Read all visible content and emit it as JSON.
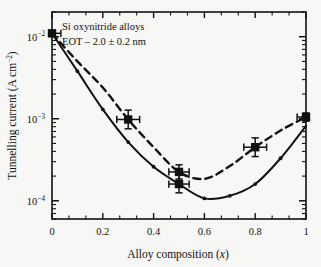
{
  "figure": {
    "background_color": "#f7f7f5",
    "ink_color": "#111111"
  },
  "annotations": {
    "line1": "Si oxynitride alloys",
    "line2": "EOT – 2.0 ± 0.2 nm"
  },
  "axes": {
    "x": {
      "label_main": "Alloy composition (",
      "label_var": "x",
      "label_close": ")",
      "ticks": [
        "0",
        "0.2",
        "0.4",
        "0.6",
        "0.8",
        "1"
      ],
      "tick_values": [
        0,
        0.2,
        0.4,
        0.6,
        0.8,
        1
      ],
      "minor_per_interval": 2,
      "range": [
        0,
        1
      ]
    },
    "y": {
      "label_main": "Tunnelling current (A cm",
      "label_sup": "−2",
      "label_close": ")",
      "ticks": [
        {
          "mantissa": "10",
          "exponent": "−2",
          "value": 0.01
        },
        {
          "mantissa": "10",
          "exponent": "−3",
          "value": 0.001
        },
        {
          "mantissa": "10",
          "exponent": "−4",
          "value": 0.0001
        }
      ],
      "scale": "log",
      "range": [
        6e-05,
        0.02
      ]
    }
  },
  "chart_data": {
    "type": "line",
    "title": "",
    "xlabel": "Alloy composition (x)",
    "ylabel": "Tunnelling current (A cm-2)",
    "xlim": [
      0,
      1
    ],
    "ylim": [
      6e-05,
      0.02
    ],
    "yscale": "log",
    "grid": false,
    "legend": "none",
    "annotations": [
      "Si oxynitride alloys",
      "EOT - 2.0 +/- 0.2 nm"
    ],
    "series": [
      {
        "name": "dashed-curve",
        "style": "dashed",
        "marker": "none",
        "x": [
          0.0,
          0.1,
          0.2,
          0.3,
          0.4,
          0.5,
          0.6,
          0.7,
          0.8,
          0.9,
          1.0
        ],
        "values": [
          0.011,
          0.005,
          0.0024,
          0.00098,
          0.00045,
          0.000225,
          0.000185,
          0.000265,
          0.00045,
          0.00072,
          0.00105
        ]
      },
      {
        "name": "solid-curve",
        "style": "solid",
        "marker": "small-dot",
        "x": [
          0.0,
          0.1,
          0.2,
          0.3,
          0.4,
          0.5,
          0.6,
          0.7,
          0.8,
          0.9,
          1.0
        ],
        "values": [
          0.011,
          0.0038,
          0.0013,
          0.00052,
          0.00026,
          0.00016,
          0.000107,
          0.000115,
          0.00016,
          0.00033,
          0.00082
        ]
      }
    ],
    "points": [
      {
        "label": "p0",
        "x": 0.0,
        "y": 0.011,
        "xerr": 0.035,
        "yerr_factor": 1.0,
        "marker": "square"
      },
      {
        "label": "p1",
        "x": 0.3,
        "y": 0.00098,
        "xerr": 0.045,
        "yerr_factor": 1.3,
        "marker": "square"
      },
      {
        "label": "p2",
        "x": 0.5,
        "y": 0.000225,
        "xerr": 0.04,
        "yerr_factor": 1.22,
        "marker": "square"
      },
      {
        "label": "p3",
        "x": 0.5,
        "y": 0.00016,
        "xerr": 0.04,
        "yerr_factor": 1.28,
        "marker": "square"
      },
      {
        "label": "p4",
        "x": 0.8,
        "y": 0.00045,
        "xerr": 0.045,
        "yerr_factor": 1.3,
        "marker": "square"
      },
      {
        "label": "p5",
        "x": 1.0,
        "y": 0.00105,
        "xerr": 0.035,
        "yerr_factor": 1.12,
        "marker": "square"
      }
    ]
  }
}
